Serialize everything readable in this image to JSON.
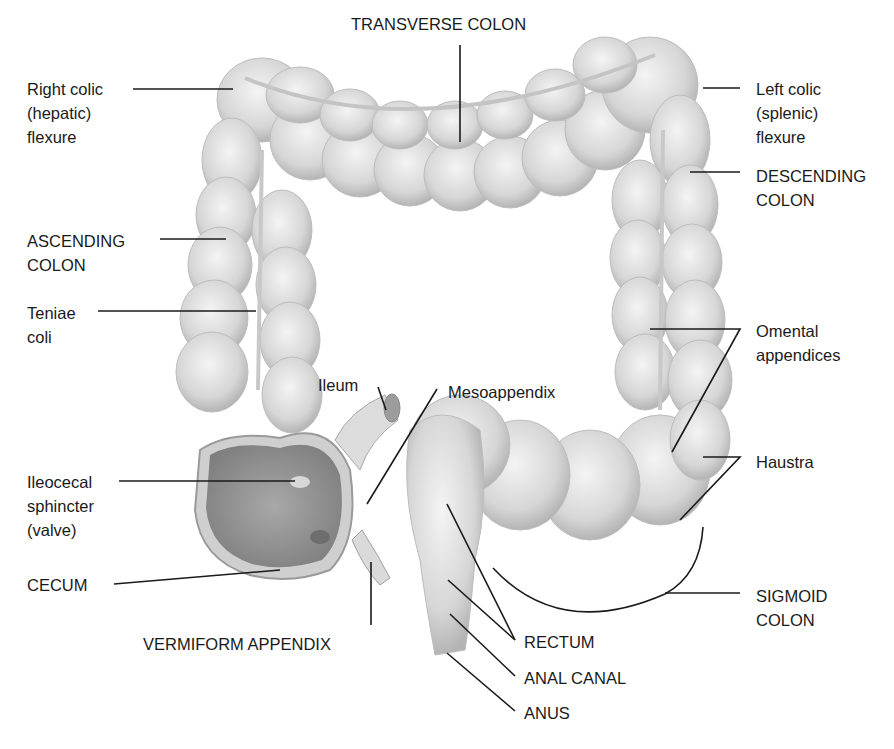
{
  "figure": {
    "background": "#ffffff",
    "tissue_color": "#d9d9d9",
    "line_color": "#1a1a1a"
  },
  "labels": {
    "transverse_colon": "TRANSVERSE COLON",
    "right_colic_flexure": "Right colic\n(hepatic)\nflexure",
    "left_colic_flexure": "Left colic\n(splenic)\nflexure",
    "descending_colon": "DESCENDING\nCOLON",
    "ascending_colon": "ASCENDING\nCOLON",
    "teniae_coli": "Teniae\ncoli",
    "omental_appendices": "Omental\nappendices",
    "ileum": "Ileum",
    "mesoappendix": "Mesoappendix",
    "haustra": "Haustra",
    "ileocecal_sphincter": "Ileocecal\nsphincter\n(valve)",
    "cecum": "CECUM",
    "sigmoid_colon": "SIGMOID\nCOLON",
    "vermiform_appendix": "VERMIFORM APPENDIX",
    "rectum": "RECTUM",
    "anal_canal": "ANAL CANAL",
    "anus": "ANUS"
  }
}
